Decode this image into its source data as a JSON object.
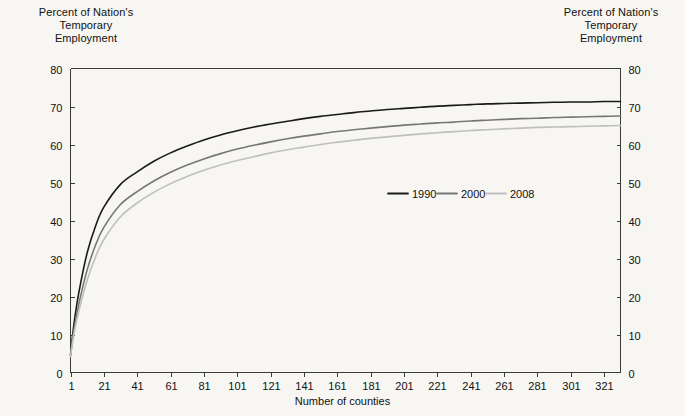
{
  "figure": {
    "background_color": "#f7f6f3",
    "axis_color": "#3a3a3a"
  },
  "titles": {
    "left_axis_title": "Percent of Nation's\nTemporary\nEmployment",
    "right_axis_title": "Percent of Nation's\nTemporary\nEmployment",
    "x_axis_label": "Number of counties"
  },
  "chart_data": {
    "type": "line",
    "title": "",
    "xlabel": "Number of counties",
    "ylabel": "Percent of Nation's Temporary Employment",
    "xlim": [
      1,
      331
    ],
    "ylim": [
      0,
      80
    ],
    "grid": false,
    "legend_position": "center-right-inside",
    "xticks": [
      1,
      21,
      41,
      61,
      81,
      101,
      121,
      141,
      161,
      181,
      201,
      221,
      241,
      261,
      281,
      301,
      321
    ],
    "yticks": [
      0,
      10,
      20,
      30,
      40,
      50,
      60,
      70,
      80
    ],
    "right_axis_yticks": [
      0,
      10,
      20,
      30,
      40,
      50,
      60,
      70,
      80
    ],
    "x": [
      1,
      3,
      6,
      11,
      16,
      21,
      31,
      41,
      51,
      61,
      71,
      81,
      91,
      101,
      111,
      121,
      131,
      141,
      151,
      161,
      171,
      181,
      191,
      201,
      211,
      221,
      231,
      241,
      251,
      261,
      271,
      281,
      291,
      301,
      311,
      321,
      331
    ],
    "series": [
      {
        "name": "1990",
        "color": "#1a1a1a",
        "values": [
          4.6,
          12.5,
          21.0,
          31.5,
          38.5,
          43.5,
          49.5,
          52.8,
          55.6,
          57.8,
          59.6,
          61.2,
          62.5,
          63.6,
          64.6,
          65.4,
          66.1,
          66.8,
          67.4,
          67.9,
          68.4,
          68.8,
          69.2,
          69.5,
          69.8,
          70.1,
          70.3,
          70.5,
          70.7,
          70.8,
          70.9,
          71.0,
          71.1,
          71.2,
          71.2,
          71.3,
          71.3
        ]
      },
      {
        "name": "2000",
        "color": "#777777",
        "values": [
          4.4,
          11.0,
          18.0,
          27.0,
          33.5,
          38.2,
          44.2,
          47.6,
          50.4,
          52.7,
          54.6,
          56.2,
          57.6,
          58.8,
          59.8,
          60.7,
          61.5,
          62.2,
          62.8,
          63.4,
          63.9,
          64.3,
          64.7,
          65.1,
          65.4,
          65.7,
          65.9,
          66.2,
          66.4,
          66.6,
          66.8,
          66.9,
          67.1,
          67.2,
          67.3,
          67.4,
          67.5
        ]
      },
      {
        "name": "2008",
        "color": "#bfbfbf",
        "values": [
          4.2,
          10.0,
          16.2,
          24.3,
          30.4,
          35.0,
          41.0,
          44.6,
          47.4,
          49.7,
          51.6,
          53.2,
          54.6,
          55.8,
          56.8,
          57.8,
          58.6,
          59.3,
          60.0,
          60.6,
          61.1,
          61.6,
          62.0,
          62.4,
          62.8,
          63.1,
          63.4,
          63.7,
          63.9,
          64.1,
          64.3,
          64.5,
          64.6,
          64.7,
          64.8,
          64.9,
          65.0
        ]
      }
    ],
    "legend": [
      {
        "label": "1990",
        "color": "#1a1a1a"
      },
      {
        "label": "2000",
        "color": "#777777"
      },
      {
        "label": "2008",
        "color": "#bfbfbf"
      }
    ]
  }
}
